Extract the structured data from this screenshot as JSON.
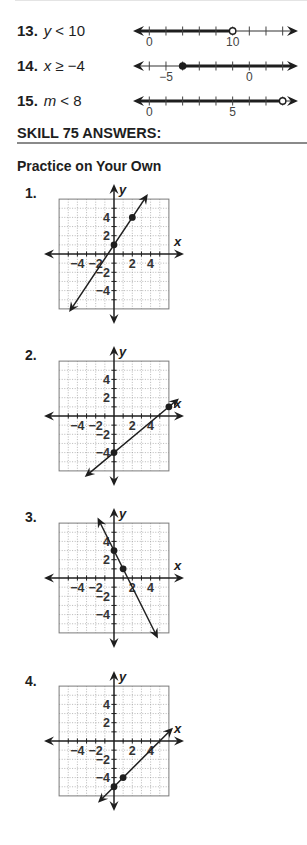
{
  "inequalities": [
    {
      "number": "13.",
      "variable": "y",
      "relation": "< 10"
    },
    {
      "number": "14.",
      "variable": "x",
      "relation": "≥ −4"
    },
    {
      "number": "15.",
      "variable": "m",
      "relation": "< 8"
    }
  ],
  "section": {
    "title": "SKILL 75 ANSWERS:",
    "subtitle": "Practice on Your Own"
  },
  "practice": {
    "labels": [
      "1.",
      "2.",
      "3.",
      "4."
    ]
  },
  "colors": {
    "ink": "#1e1e1e",
    "grid": "#9a9a9a",
    "grid_border": "#7a7a7a",
    "rule": "#8a8a8a",
    "label": "#444444"
  },
  "chart_data": [
    {
      "type": "number_line",
      "label": "13. y < 10",
      "ticks": [
        0,
        2,
        4,
        6,
        8,
        10,
        12,
        14,
        16
      ],
      "tick_labels": [
        {
          "value": 0,
          "text": "0"
        },
        {
          "value": 10,
          "text": "10"
        }
      ],
      "endpoint": {
        "value": 10,
        "style": "open"
      },
      "direction": "left"
    },
    {
      "type": "number_line",
      "label": "14. x ≥ −4",
      "ticks": [
        -6,
        -5,
        -4,
        -3,
        -2,
        -1,
        0,
        1,
        2
      ],
      "tick_labels": [
        {
          "value": -5,
          "text": "−5"
        },
        {
          "value": 0,
          "text": "0"
        }
      ],
      "endpoint": {
        "value": -4,
        "style": "closed"
      },
      "direction": "right"
    },
    {
      "type": "number_line",
      "label": "15. m < 8",
      "ticks": [
        0,
        1,
        2,
        3,
        4,
        5,
        6,
        7,
        8
      ],
      "tick_labels": [
        {
          "value": 0,
          "text": "0"
        },
        {
          "value": 5,
          "text": "5"
        }
      ],
      "endpoint": {
        "value": 8,
        "style": "open"
      },
      "direction": "left"
    },
    {
      "type": "line",
      "label": "1.",
      "xlabel": "x",
      "ylabel": "y",
      "xlim": [
        -6,
        6
      ],
      "ylim": [
        -6,
        6
      ],
      "grid": true,
      "x_tick_labels": [
        {
          "value": -4,
          "text": "−4"
        },
        {
          "value": -2,
          "text": "−2"
        },
        {
          "value": 2,
          "text": "2"
        },
        {
          "value": 4,
          "text": "4"
        }
      ],
      "y_tick_labels": [
        {
          "value": 4,
          "text": "4"
        },
        {
          "value": 2,
          "text": "2"
        },
        {
          "value": -2,
          "text": "−2"
        },
        {
          "value": -4,
          "text": "−4"
        }
      ],
      "points": [
        [
          0,
          1
        ],
        [
          2,
          4
        ]
      ],
      "line": {
        "from": [
          -4.9,
          -6.35
        ],
        "to": [
          3.7,
          6.55
        ]
      }
    },
    {
      "type": "line",
      "label": "2.",
      "xlabel": "x",
      "ylabel": "y",
      "xlim": [
        -6,
        6
      ],
      "ylim": [
        -6,
        6
      ],
      "grid": true,
      "x_tick_labels": [
        {
          "value": -4,
          "text": "−4"
        },
        {
          "value": -2,
          "text": "−2"
        },
        {
          "value": 2,
          "text": "2"
        },
        {
          "value": 4,
          "text": "4"
        }
      ],
      "y_tick_labels": [
        {
          "value": 4,
          "text": "4"
        },
        {
          "value": 2,
          "text": "2"
        },
        {
          "value": -2,
          "text": "−2"
        },
        {
          "value": -4,
          "text": "−4"
        }
      ],
      "points": [
        [
          0,
          -4
        ],
        [
          6,
          1
        ]
      ],
      "line": {
        "from": [
          -3.2,
          -6.67
        ],
        "to": [
          7.1,
          1.92
        ]
      }
    },
    {
      "type": "line",
      "label": "3.",
      "xlabel": "x",
      "ylabel": "y",
      "xlim": [
        -6,
        6
      ],
      "ylim": [
        -6,
        6
      ],
      "grid": true,
      "x_tick_labels": [
        {
          "value": -4,
          "text": "−4"
        },
        {
          "value": -2,
          "text": "−2"
        },
        {
          "value": 2,
          "text": "2"
        },
        {
          "value": 4,
          "text": "4"
        }
      ],
      "y_tick_labels": [
        {
          "value": 4,
          "text": "4"
        },
        {
          "value": 2,
          "text": "2"
        },
        {
          "value": -2,
          "text": "−2"
        },
        {
          "value": -4,
          "text": "−4"
        }
      ],
      "points": [
        [
          0,
          3
        ],
        [
          1,
          1
        ]
      ],
      "line": {
        "from": [
          -1.8,
          6.6
        ],
        "to": [
          4.8,
          -6.6
        ]
      }
    },
    {
      "type": "line",
      "label": "4.",
      "xlabel": "x",
      "ylabel": "y",
      "xlim": [
        -6,
        6
      ],
      "ylim": [
        -6,
        6
      ],
      "grid": true,
      "x_tick_labels": [
        {
          "value": -4,
          "text": "−4"
        },
        {
          "value": -2,
          "text": "−2"
        },
        {
          "value": 2,
          "text": "2"
        },
        {
          "value": 4,
          "text": "4"
        }
      ],
      "y_tick_labels": [
        {
          "value": 4,
          "text": "4"
        },
        {
          "value": 2,
          "text": "2"
        },
        {
          "value": -2,
          "text": "−2"
        },
        {
          "value": -4,
          "text": "−4"
        }
      ],
      "points": [
        [
          0,
          -5
        ],
        [
          1,
          -4
        ]
      ],
      "line": {
        "from": [
          -1.75,
          -6.75
        ],
        "to": [
          6.45,
          1.45
        ]
      }
    }
  ]
}
